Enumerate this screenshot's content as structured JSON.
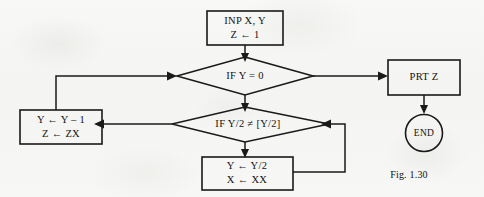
{
  "figure": {
    "caption": "Fig. 1.30",
    "background_color": "#f7f7f5",
    "ink_color": "#1a1a1a"
  },
  "nodes": {
    "input_box": {
      "shape": "process-box",
      "line1": "INP X, Y",
      "line2": "Z ← 1"
    },
    "decision_y_zero": {
      "shape": "decision-diamond",
      "text": "IF Y = 0"
    },
    "decision_y_half": {
      "shape": "decision-diamond",
      "text": "IF Y/2 ≠ [Y/2]"
    },
    "update_odd_box": {
      "shape": "process-box",
      "line1": "Y ← Y – 1",
      "line2": "Z ← ZX"
    },
    "update_halve_box": {
      "shape": "process-box",
      "line1": "Y ← Y/2",
      "line2": "X ← XX"
    },
    "print_box": {
      "shape": "process-box",
      "text": "PRT Z"
    },
    "end_terminator": {
      "shape": "circle",
      "text": "END"
    }
  },
  "connectors": [
    {
      "name": "input-to-decision-y-zero",
      "from": "input_box",
      "to": "decision_y_zero",
      "arrow": true
    },
    {
      "name": "decision-y-zero-yes-to-print",
      "from": "decision_y_zero",
      "to": "print_box",
      "arrow": true
    },
    {
      "name": "decision-y-zero-no-to-decision-y-half",
      "from": "decision_y_zero",
      "to": "decision_y_half",
      "arrow": true
    },
    {
      "name": "decision-y-half-to-update-odd",
      "from": "decision_y_half",
      "to": "update_odd_box",
      "arrow": true
    },
    {
      "name": "decision-y-half-to-update-halve",
      "from": "decision_y_half",
      "to": "update_halve_box",
      "arrow": true
    },
    {
      "name": "update-odd-loop-back-to-decision-y-zero",
      "from": "update_odd_box",
      "to": "decision_y_zero",
      "arrow": true
    },
    {
      "name": "update-halve-loop-back-to-decision-y-half",
      "from": "update_halve_box",
      "to": "decision_y_half",
      "arrow": true
    },
    {
      "name": "print-to-end",
      "from": "print_box",
      "to": "end_terminator",
      "arrow": true
    }
  ]
}
